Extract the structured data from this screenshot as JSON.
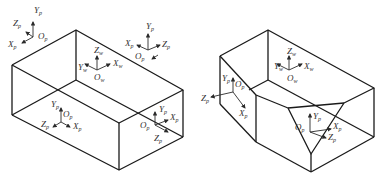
{
  "figure": {
    "left_panel": {
      "shape": "rectangular box",
      "world_frame": {
        "x": "X",
        "y": "Y",
        "z": "Z",
        "origin": "O",
        "sub": "w"
      },
      "part_frames": [
        {
          "id": "top-left",
          "labels": {
            "x": "X",
            "y": "Y",
            "z": "Z",
            "origin": "O"
          },
          "sub": "p"
        },
        {
          "id": "top-right",
          "labels": {
            "x": "X",
            "y": "Y",
            "z": "Z",
            "origin": "O"
          },
          "sub": "p"
        },
        {
          "id": "left-face",
          "labels": {
            "x": "X",
            "y": "Y",
            "z": "Z",
            "origin": "O"
          },
          "sub": "p"
        },
        {
          "id": "front-face",
          "labels": {
            "x": "X",
            "y": "Y",
            "z": "Z",
            "origin": "O"
          },
          "sub": "p"
        }
      ]
    },
    "right_panel": {
      "shape": "box with chamfered corners",
      "world_frame": {
        "x": "X",
        "y": "Y",
        "z": "Z",
        "origin": "O",
        "sub": "w"
      },
      "part_frames": [
        {
          "id": "left-chamfer",
          "labels": {
            "x": "X",
            "y": "Y",
            "z": "Z",
            "origin": "O"
          },
          "sub": "p"
        },
        {
          "id": "triangle-chamfer",
          "labels": {
            "x": "X",
            "y": "Y",
            "z": "Z",
            "origin": "O"
          },
          "sub": "p"
        }
      ]
    },
    "colors": {
      "line": "#1a1a1a",
      "text": "#333333",
      "background": "#ffffff"
    }
  }
}
